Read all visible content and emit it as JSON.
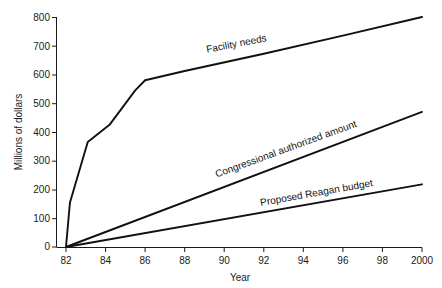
{
  "chart_data": {
    "type": "line",
    "title": "",
    "xlabel": "Year",
    "ylabel": "Millions of dollars",
    "grid": false,
    "legend_position": "inline-along-lines",
    "xlim": [
      82,
      100
    ],
    "ylim": [
      0,
      800
    ],
    "x_tick_labels": [
      "82",
      "84",
      "86",
      "88",
      "90",
      "92",
      "94",
      "96",
      "98",
      "2000"
    ],
    "x_tick_values": [
      82,
      84,
      86,
      88,
      90,
      92,
      94,
      96,
      98,
      100
    ],
    "y_tick_labels": [
      "0",
      "100",
      "200",
      "300",
      "400",
      "500",
      "600",
      "700",
      "800"
    ],
    "y_tick_values": [
      0,
      100,
      200,
      300,
      400,
      500,
      600,
      700,
      800
    ],
    "series": [
      {
        "name": "Facility needs",
        "label": "Facility needs",
        "color": "#111111",
        "x": [
          82,
          82.2,
          83.1,
          84.2,
          85.5,
          86.0,
          88.0,
          92.0,
          96.0,
          100.0
        ],
        "values": [
          0,
          155,
          365,
          425,
          545,
          580,
          612,
          672,
          735,
          800
        ]
      },
      {
        "name": "Congressional authorized amount",
        "label": "Congressional authorized amount",
        "color": "#111111",
        "x": [
          82,
          100
        ],
        "values": [
          0,
          470
        ]
      },
      {
        "name": "Proposed Reagan budget",
        "label": "Proposed Reagan budget",
        "color": "#111111",
        "x": [
          82,
          100
        ],
        "values": [
          0,
          218
        ]
      }
    ]
  },
  "axes": {
    "y_title": "Millions of dollars",
    "x_title": "Year"
  },
  "labels": {
    "facility_needs": "Facility needs",
    "congressional": "Congressional authorized amount",
    "reagan": "Proposed Reagan budget"
  },
  "ticks": {
    "y": [
      "800",
      "700",
      "600",
      "500",
      "400",
      "300",
      "200",
      "100",
      "0"
    ],
    "x": [
      "82",
      "84",
      "86",
      "88",
      "90",
      "92",
      "94",
      "96",
      "98",
      "2000"
    ]
  }
}
